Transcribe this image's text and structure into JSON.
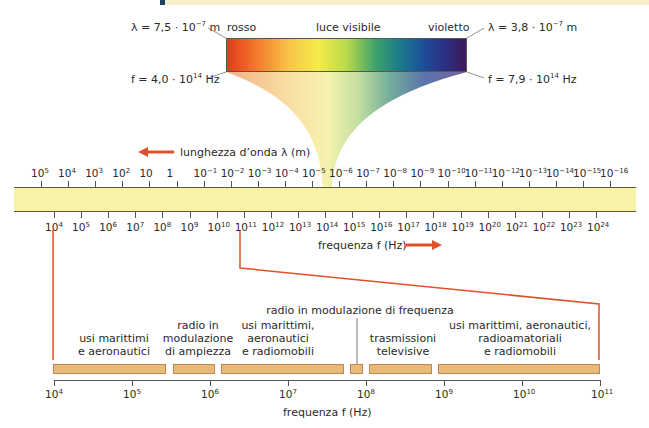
{
  "header": {
    "accent_color": "#1f3e63",
    "band_color": "#f7edc8"
  },
  "visible_spectrum": {
    "title": "luce visibile",
    "left_label": "rosso",
    "right_label": "violetto",
    "red_wavelength": {
      "prefix": "λ = 7,5 · 10",
      "exp": "−7",
      "unit": " m"
    },
    "red_frequency": {
      "prefix": "f = 4,0 · 10",
      "exp": "14",
      "unit": " Hz"
    },
    "violet_wavelength": {
      "prefix": "λ = 3,8 · 10",
      "exp": "−7",
      "unit": " m"
    },
    "violet_frequency": {
      "prefix": "f = 7,9 · 10",
      "exp": "14",
      "unit": " Hz"
    }
  },
  "wavelength_axis": {
    "label": "lunghezza d’onda λ (m)",
    "ticks": [
      {
        "base": "10",
        "exp": "5"
      },
      {
        "base": "10",
        "exp": "4"
      },
      {
        "base": "10",
        "exp": "3"
      },
      {
        "base": "10",
        "exp": "2"
      },
      {
        "base": "10",
        "exp": ""
      },
      {
        "base": "1",
        "exp": ""
      },
      {
        "base": "10",
        "exp": "−1"
      },
      {
        "base": "10",
        "exp": "−2"
      },
      {
        "base": "10",
        "exp": "−3"
      },
      {
        "base": "10",
        "exp": "−4"
      },
      {
        "base": "10",
        "exp": "−5"
      },
      {
        "base": "10",
        "exp": "−6"
      },
      {
        "base": "10",
        "exp": "−7"
      },
      {
        "base": "10",
        "exp": "−8"
      },
      {
        "base": "10",
        "exp": "−9"
      },
      {
        "base": "10",
        "exp": "−10"
      },
      {
        "base": "10",
        "exp": "−11"
      },
      {
        "base": "10",
        "exp": "−12"
      },
      {
        "base": "10",
        "exp": "−13"
      },
      {
        "base": "10",
        "exp": "−14"
      },
      {
        "base": "10",
        "exp": "−15"
      },
      {
        "base": "10",
        "exp": "−16"
      }
    ]
  },
  "frequency_axis": {
    "label": "frequenza f (Hz)",
    "ticks": [
      "4",
      "5",
      "6",
      "7",
      "8",
      "9",
      "10",
      "11",
      "12",
      "13",
      "14",
      "15",
      "16",
      "17",
      "18",
      "19",
      "20",
      "21",
      "22",
      "23",
      "24"
    ]
  },
  "radio_detail": {
    "axis_label": "frequenza f (Hz)",
    "ticks": [
      "4",
      "5",
      "6",
      "7",
      "8",
      "9",
      "10",
      "11"
    ],
    "bands": [
      {
        "label_lines": [
          "usi marittimi",
          "e aeronautici"
        ]
      },
      {
        "label_lines": [
          "radio in",
          "modulazione",
          "di ampiezza"
        ]
      },
      {
        "label_lines": [
          "usi marittimi,",
          "aeronautici",
          "e radiomobili"
        ]
      },
      {
        "label_lines": [
          "radio in modulazione di frequenza"
        ]
      },
      {
        "label_lines": [
          "trasmissioni",
          "televisive"
        ]
      },
      {
        "label_lines": [
          "usi marittimi, aeronautici,",
          "radioamatoriali",
          "e radiomobili"
        ]
      }
    ]
  },
  "colors": {
    "arrow": "#e0502a",
    "band": "#f8f2a6",
    "segment": "#e8b978"
  }
}
